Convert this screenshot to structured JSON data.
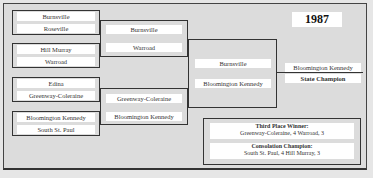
{
  "year": "1987",
  "quarterfinals": [
    {
      "top": "Burnsville",
      "bottom": "Roseville"
    },
    {
      "top": "Hill Murray",
      "bottom": "Warroad"
    },
    {
      "top": "Edina",
      "bottom": "Greenway-Coleraine"
    },
    {
      "top": "Bloomington Kennedy",
      "bottom": "South St. Paul"
    }
  ],
  "semifinals": [
    {
      "top": "Burnsville",
      "bottom": "Warroad"
    },
    {
      "top": "Greenway-Coleraine",
      "bottom": "Bloomington Kennedy"
    }
  ],
  "final": {
    "top": "Burnsville",
    "bottom": "Bloomington Kennedy"
  },
  "champion": {
    "name": "Bloomington Kennedy",
    "label": "State Champion"
  },
  "third_place": {
    "title": "Third Place Winner:",
    "result": "Greenway-Coleraine, 4  Warroad, 3"
  },
  "consolation": {
    "title": "Consolation Champion:",
    "result": "South St. Paul, 4  Hill Murray, 3"
  }
}
